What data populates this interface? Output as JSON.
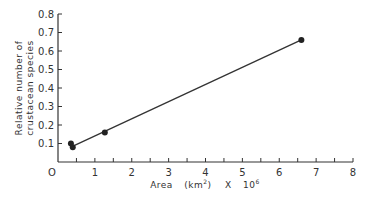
{
  "chart_data": {
    "type": "scatter",
    "title": "",
    "xlabel": "Area (km²) X 10⁶",
    "xlabel_parts": {
      "main": "Area",
      "unit": "(km",
      "sup": "2",
      "unit_end": ")",
      "mult": "X",
      "base": "10",
      "exp": "6"
    },
    "ylabel_line1": "Relative number of",
    "ylabel_line2": "crustacean species",
    "xlim": [
      0,
      8
    ],
    "ylim": [
      0,
      0.8
    ],
    "x_ticks": [
      "O",
      "1",
      "2",
      "3",
      "4",
      "5",
      "6",
      "7",
      "8"
    ],
    "x_minor_ticks": [
      0.5,
      1.5,
      2.5,
      3.5,
      4.5,
      5.5,
      6.5,
      7.5
    ],
    "y_ticks": [
      "0.1",
      "0.2",
      "0.3",
      "0.4",
      "0.5",
      "0.6",
      "0.7",
      "0.8"
    ],
    "grid": false,
    "legend": null,
    "series": [
      {
        "name": "observations",
        "points": [
          {
            "x": 0.35,
            "y": 0.1
          },
          {
            "x": 0.4,
            "y": 0.08
          },
          {
            "x": 1.27,
            "y": 0.16
          },
          {
            "x": 6.6,
            "y": 0.66
          }
        ]
      }
    ],
    "fit_line": {
      "x1": 0.45,
      "y1": 0.09,
      "x2": 6.6,
      "y2": 0.66
    }
  }
}
